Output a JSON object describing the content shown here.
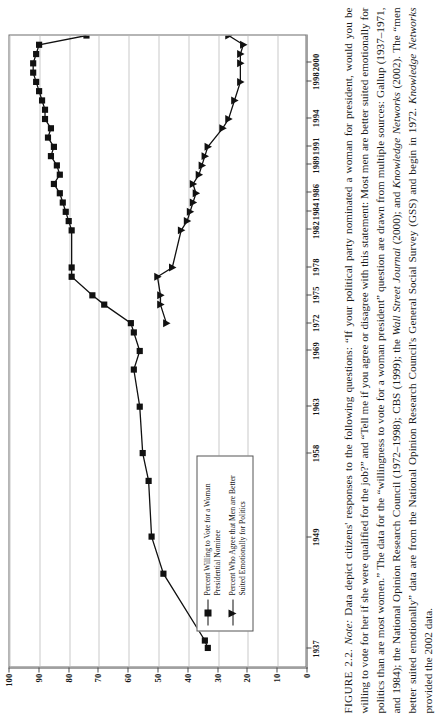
{
  "figure": {
    "number_label": "FIGURE 2.2.",
    "note_label": "Note:",
    "caption_text": " Data depict citizens' responses to the following questions: “If your political party nominated a woman for president, would you be willing to vote for her if she were qualified for the job?” and “Tell me if you agree or disagree with this statement: Most men are better suited emotionally for politics than are most women.” The data for the “willingness to vote for a woman president” question are drawn from multiple sources: Gallup (1937–1971, and 1984); the National Opinion Research Council (1972–1998); CBS (1999); the ",
    "caption_italic_1": "Wall Street Journal",
    "caption_mid_1": " (2000); and ",
    "caption_italic_2": "Knowledge Networks",
    "caption_mid_2": " (2002). The “men better suited emotionally” data are from the National Opinion Research Council's General Social Survey (GSS) and begin in 1972. ",
    "caption_italic_3": "Knowledge Networks",
    "caption_end": " provided the 2002 data."
  },
  "legend": {
    "position": "inside-lower-left",
    "entries": [
      {
        "marker": "square",
        "label": "Percent Willing to Vote for a Woman Presidential Nominee"
      },
      {
        "marker": "triangle",
        "label": "Percent Who Agree that Men are Better Suited Emotionally for Politics"
      }
    ]
  },
  "chart_data": {
    "type": "line",
    "title": "",
    "xlabel": "",
    "ylabel": "",
    "ylim": [
      0,
      100
    ],
    "ytick_values": [
      0,
      10,
      20,
      30,
      40,
      50,
      60,
      70,
      80,
      90,
      100
    ],
    "ytick_labels": [
      "0",
      "10",
      "20",
      "30",
      "40",
      "50",
      "60",
      "70",
      "80",
      "90",
      "100"
    ],
    "grid": true,
    "grid_axis": "y",
    "xtick_labels": [
      "1937",
      "1949",
      "1958",
      "1963",
      "1969",
      "1972",
      "1975",
      "1978",
      "1982",
      "1984",
      "1986",
      "1989",
      "1991",
      "1994",
      "1998",
      "2000"
    ],
    "xtick_years": [
      1937,
      1949,
      1958,
      1963,
      1969,
      1972,
      1975,
      1978,
      1982,
      1984,
      1986,
      1989,
      1991,
      1994,
      1998,
      2000
    ],
    "xlim": [
      1935,
      2003
    ],
    "series": [
      {
        "name": "Percent Willing to Vote for a Woman Presidential Nominee",
        "marker": "square",
        "color": "#111111",
        "points": [
          [
            1937,
            33
          ],
          [
            1937.8,
            34
          ],
          [
            1945,
            48
          ],
          [
            1949,
            52
          ],
          [
            1955,
            53
          ],
          [
            1958,
            55
          ],
          [
            1963,
            56
          ],
          [
            1967,
            58
          ],
          [
            1969,
            56
          ],
          [
            1971,
            58
          ],
          [
            1972,
            59
          ],
          [
            1974,
            68
          ],
          [
            1975,
            72
          ],
          [
            1977,
            79
          ],
          [
            1978,
            79
          ],
          [
            1982,
            79
          ],
          [
            1983,
            80
          ],
          [
            1984,
            81
          ],
          [
            1985,
            82
          ],
          [
            1986,
            83
          ],
          [
            1987,
            85
          ],
          [
            1988,
            83
          ],
          [
            1989,
            84
          ],
          [
            1990,
            86
          ],
          [
            1991,
            85
          ],
          [
            1992,
            87
          ],
          [
            1993,
            86
          ],
          [
            1994,
            88
          ],
          [
            1995,
            88
          ],
          [
            1996,
            89
          ],
          [
            1997,
            90
          ],
          [
            1998,
            91
          ],
          [
            1999,
            92
          ],
          [
            2000,
            92
          ],
          [
            2001,
            91
          ],
          [
            2002,
            90
          ],
          [
            2003,
            74
          ]
        ]
      },
      {
        "name": "Percent Who Agree that Men are Better Suited Emotionally for Politics",
        "marker": "triangle",
        "color": "#111111",
        "points": [
          [
            1972,
            47
          ],
          [
            1974,
            49
          ],
          [
            1975,
            49
          ],
          [
            1977,
            50
          ],
          [
            1978,
            45
          ],
          [
            1982,
            42
          ],
          [
            1983,
            40
          ],
          [
            1984,
            39
          ],
          [
            1985,
            38
          ],
          [
            1986,
            37
          ],
          [
            1987,
            38
          ],
          [
            1988,
            36
          ],
          [
            1989,
            35
          ],
          [
            1990,
            34
          ],
          [
            1991,
            33
          ],
          [
            1993,
            28
          ],
          [
            1994,
            26
          ],
          [
            1996,
            24
          ],
          [
            1998,
            22
          ],
          [
            2000,
            22
          ],
          [
            2001,
            22
          ],
          [
            2002,
            21
          ],
          [
            2003,
            26
          ]
        ]
      }
    ]
  }
}
